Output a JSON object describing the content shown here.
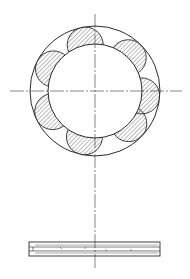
{
  "drawing": {
    "type": "technical-drawing",
    "views": [
      "front-view",
      "side-view"
    ],
    "colors": {
      "line": "#2a2a2a",
      "hatch": "#555555",
      "background": "#ffffff"
    },
    "front_view": {
      "center": [
        95,
        91
      ],
      "outer_radius": 65,
      "inner_radius": 47,
      "lobe_radius": 18,
      "lobe_count": 7,
      "lobe_angles_deg": [
        -102,
        -45,
        6,
        44,
        103,
        154,
        -152
      ]
    },
    "side_view": {
      "x": 29,
      "y": 242,
      "width": 131,
      "height": 14
    }
  }
}
